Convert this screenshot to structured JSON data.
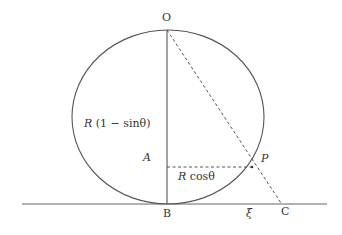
{
  "diagram": {
    "labels": {
      "O": "O",
      "A": "A",
      "B": "B",
      "C": "C",
      "P": "P",
      "xi": "ξ",
      "height_R": "R",
      "height_expr": " (1 − sinθ)",
      "horiz_R": "R",
      "horiz_expr": " cosθ"
    },
    "colors": {
      "stroke": "#555555",
      "text": "#333333"
    }
  }
}
